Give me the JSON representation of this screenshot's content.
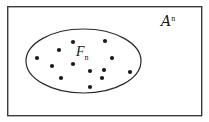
{
  "figure": {
    "canvas": {
      "width": 209,
      "height": 122,
      "background": "#ffffff"
    },
    "frame": {
      "name": "outer-rectangle",
      "x": 7,
      "y": 6,
      "width": 195,
      "height": 110,
      "stroke": "#3b3b3b",
      "stroke_width": 1.4,
      "fill": "#ffffff"
    },
    "ellipse": {
      "name": "subset-ellipse",
      "cx": 83.5,
      "cy": 61,
      "rx": 57.5,
      "ry": 32,
      "stroke": "#2a2a2a",
      "stroke_width": 1.2,
      "fill": "none"
    },
    "labels": {
      "universe": {
        "base": "A",
        "superscript": "n",
        "full_text": "A^n",
        "x": 161,
        "y": 14,
        "color": "#151515"
      },
      "subset": {
        "base": "F",
        "subscript": "n",
        "full_text": "F_n",
        "x": 76,
        "y": 45,
        "color": "#151515"
      }
    },
    "points": {
      "name": "element-dots",
      "count": 13,
      "radius": 2.1,
      "color": "#1a1a1a",
      "coords": [
        {
          "x": 73,
          "y": 42
        },
        {
          "x": 105,
          "y": 41
        },
        {
          "x": 59,
          "y": 50
        },
        {
          "x": 37,
          "y": 58
        },
        {
          "x": 112,
          "y": 58
        },
        {
          "x": 52,
          "y": 66
        },
        {
          "x": 73,
          "y": 64
        },
        {
          "x": 90,
          "y": 71
        },
        {
          "x": 104,
          "y": 70
        },
        {
          "x": 130,
          "y": 72
        },
        {
          "x": 61,
          "y": 78
        },
        {
          "x": 102,
          "y": 78
        },
        {
          "x": 90,
          "y": 87
        }
      ]
    }
  }
}
